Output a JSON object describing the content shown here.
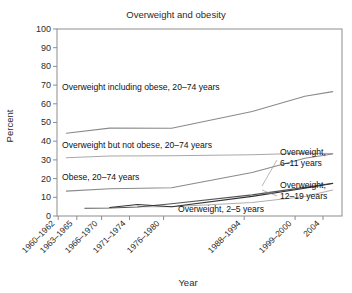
{
  "chart_data": {
    "type": "line",
    "title": "Overweight and obesity",
    "xlabel": "Year",
    "ylabel": "Percent",
    "ylim": [
      0,
      100
    ],
    "ytick_step": 10,
    "yticks": [
      "0",
      "10",
      "20",
      "30",
      "40",
      "50",
      "60",
      "70",
      "80",
      "90",
      "100"
    ],
    "grid": false,
    "legend_position": "inline-annotations",
    "categories": [
      "1960-1962",
      "1963-1965",
      "1966-1970",
      "1971-1974",
      "1976-1980",
      "1988-1994",
      "1999-2000",
      "2004"
    ],
    "tick_labels": [
      "1960–1962",
      "1963–1965",
      "1966–1970",
      "1971–1974",
      "1976–1980",
      "1988–1994",
      "1999–2000",
      "2004"
    ],
    "x_positions": [
      1961,
      1964,
      1968,
      1972.5,
      1978,
      1991,
      1999.5,
      2004
    ],
    "xlim": [
      1959.5,
      2005.5
    ],
    "series": [
      {
        "name": "Overweight including obese, 20–74 years",
        "x": [
          1961,
          1968,
          1978,
          1991,
          1999.5,
          2004
        ],
        "values": [
          44.3,
          47.0,
          46.9,
          55.9,
          64.0,
          66.5
        ],
        "color": "#8a8a8a"
      },
      {
        "name": "Overweight but not obese, 20–74 years",
        "x": [
          1961,
          1968,
          1978,
          1991,
          1999.5,
          2004
        ],
        "values": [
          31.2,
          32.1,
          32.2,
          32.8,
          33.6,
          33.4
        ],
        "color": "#a8a8a8"
      },
      {
        "name": "Obese, 20–74 years",
        "x": [
          1961,
          1968,
          1978,
          1991,
          1999.5,
          2004
        ],
        "values": [
          13.3,
          14.6,
          15.1,
          23.3,
          30.9,
          33.2
        ],
        "color": "#8a8a8a"
      },
      {
        "name": "Overweight, 6–11 years",
        "x": [
          1964,
          1968,
          1972.5,
          1978,
          1991,
          1999.5,
          2004
        ],
        "values": [
          4.2,
          4.3,
          4.8,
          6.5,
          11.3,
          15.3,
          17.5
        ],
        "color": "#555555"
      },
      {
        "name": "Overweight, 12–19 years",
        "x": [
          1968,
          1972.5,
          1978,
          1991,
          1999.5,
          2004
        ],
        "values": [
          4.6,
          6.1,
          5.0,
          10.5,
          14.8,
          17.4
        ],
        "color": "#333333"
      },
      {
        "name": "Overweight, 2–5 years",
        "x": [
          1972.5,
          1978,
          1991,
          1999.5,
          2004
        ],
        "values": [
          5.0,
          5.0,
          7.2,
          10.4,
          13.9
        ],
        "color": "#b0b0b0"
      }
    ],
    "annotations": [
      {
        "text": "Overweight including obese, 20–74 years",
        "place": "inside"
      },
      {
        "text": "Overweight but not obese, 20–74 years",
        "place": "inside"
      },
      {
        "text": "Obese, 20–74 years",
        "place": "inside"
      },
      {
        "text": "Overweight, 2–5 years",
        "place": "inside"
      },
      {
        "text": "Overweight,",
        "text2": "6–11 years",
        "place": "right-callout"
      },
      {
        "text": "Overweight,",
        "text2": "12–19 years",
        "place": "right-callout"
      }
    ]
  },
  "labels": {
    "title": "Overweight and obesity",
    "ylabel": "Percent",
    "xlabel": "Year",
    "y0": "0",
    "y10": "10",
    "y20": "20",
    "y30": "30",
    "y40": "40",
    "y50": "50",
    "y60": "60",
    "y70": "70",
    "y80": "80",
    "y90": "90",
    "y100": "100",
    "x0": "1960–1962",
    "x1": "1963–1965",
    "x2": "1966–1970",
    "x3": "1971–1974",
    "x4": "1976–1980",
    "x5": "1988–1994",
    "x6": "1999–2000",
    "x7": "2004",
    "ann_overweight_incl_obese": "Overweight including obese, 20–74 years",
    "ann_overweight_not_obese": "Overweight but not obese, 20–74 years",
    "ann_obese": "Obese, 20–74 years",
    "ann_ow_2_5": "Overweight, 2–5 years",
    "ann_ow_6_11_l1": "Overweight,",
    "ann_ow_6_11_l2": "6–11 years",
    "ann_ow_12_19_l1": "Overweight,",
    "ann_ow_12_19_l2": "12–19 years"
  }
}
